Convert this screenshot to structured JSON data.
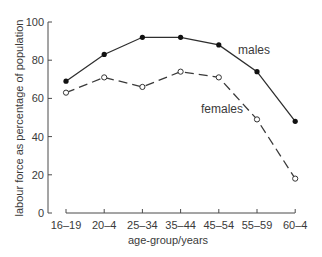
{
  "chart_data": {
    "type": "line",
    "title": "",
    "xlabel": "age-group/years",
    "ylabel": "labour force as percentage of population",
    "categories": [
      "16–19",
      "20–4",
      "25–34",
      "35–44",
      "45–54",
      "55–59",
      "60–4"
    ],
    "series": [
      {
        "name": "males",
        "style": "solid",
        "marker": "filled-circle",
        "values": [
          69,
          83,
          92,
          92,
          88,
          74,
          48
        ]
      },
      {
        "name": "females",
        "style": "dashed",
        "marker": "open-circle",
        "values": [
          63,
          71,
          66,
          74,
          71,
          49,
          18
        ]
      }
    ],
    "ylim": [
      0,
      100
    ],
    "yticks": [
      0,
      20,
      40,
      60,
      80,
      100
    ],
    "grid": false,
    "legend": "inline labels next to lines"
  },
  "labels": {
    "ytick": [
      "0",
      "20",
      "40",
      "60",
      "80",
      "100"
    ],
    "males": "males",
    "females": "females"
  },
  "colors": {
    "line": "#2e2e2e",
    "text": "#3a3a3a",
    "background": "#ffffff"
  }
}
